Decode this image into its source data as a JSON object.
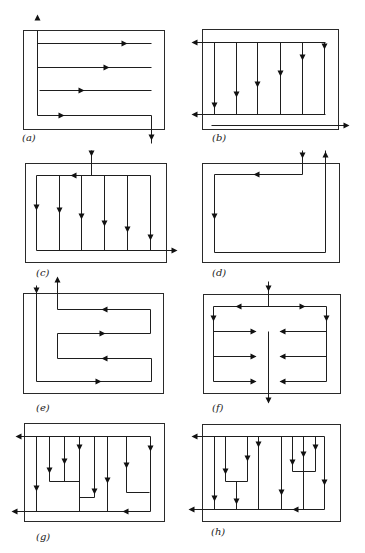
{
  "figure": {
    "width": 365,
    "height": 553,
    "colors": {
      "line": "#1e1e1e",
      "frame": "#2a2a2a",
      "background": "#ffffff"
    }
  },
  "panels": [
    {
      "id": "a",
      "label": "(a)",
      "label_pos": [
        22,
        141
      ],
      "frame": [
        23,
        30,
        164,
        129
      ],
      "paths": [
        [
          [
            37,
            30
          ],
          [
            37,
            115
          ],
          [
            151,
            115
          ],
          [
            151,
            143
          ]
        ],
        [
          [
            37,
            43
          ],
          [
            151,
            43
          ]
        ],
        [
          [
            37,
            67
          ],
          [
            151,
            67
          ]
        ],
        [
          [
            39,
            90
          ],
          [
            151,
            90
          ]
        ]
      ],
      "arrows": [
        {
          "x": 37,
          "y": 17,
          "dir": "up"
        },
        {
          "x": 124,
          "y": 43,
          "dir": "right"
        },
        {
          "x": 106,
          "y": 67,
          "dir": "right"
        },
        {
          "x": 81,
          "y": 90,
          "dir": "right"
        },
        {
          "x": 61,
          "y": 115,
          "dir": "right"
        },
        {
          "x": 151,
          "y": 137,
          "dir": "down"
        }
      ]
    },
    {
      "id": "b",
      "label": "(b)",
      "label_pos": [
        212,
        141
      ],
      "frame": [
        202,
        29,
        338,
        129
      ],
      "paths": [
        [
          [
            193,
            42
          ],
          [
            325,
            42
          ]
        ],
        [
          [
            193,
            114
          ],
          [
            325,
            114
          ]
        ],
        [
          [
            214,
            42
          ],
          [
            214,
            114
          ]
        ],
        [
          [
            236,
            42
          ],
          [
            236,
            114
          ]
        ],
        [
          [
            257,
            42
          ],
          [
            257,
            114
          ]
        ],
        [
          [
            280,
            42
          ],
          [
            280,
            114
          ]
        ],
        [
          [
            302,
            42
          ],
          [
            302,
            114
          ]
        ],
        [
          [
            324,
            42
          ],
          [
            324,
            114
          ]
        ],
        [
          [
            211,
            125
          ],
          [
            347,
            125
          ]
        ]
      ],
      "arrows": [
        {
          "x": 194,
          "y": 42,
          "dir": "left"
        },
        {
          "x": 194,
          "y": 114,
          "dir": "left"
        },
        {
          "x": 214,
          "y": 105,
          "dir": "down"
        },
        {
          "x": 236,
          "y": 94,
          "dir": "down"
        },
        {
          "x": 257,
          "y": 84,
          "dir": "down"
        },
        {
          "x": 280,
          "y": 73,
          "dir": "down"
        },
        {
          "x": 302,
          "y": 57,
          "dir": "down"
        },
        {
          "x": 324,
          "y": 46,
          "dir": "down"
        },
        {
          "x": 346,
          "y": 125,
          "dir": "right"
        }
      ]
    },
    {
      "id": "c",
      "label": "(c)",
      "label_pos": [
        36,
        276
      ],
      "frame": [
        25,
        163,
        166,
        262
      ],
      "paths": [
        [
          [
            91,
            150
          ],
          [
            91,
            175
          ]
        ],
        [
          [
            36,
            175
          ],
          [
            150,
            175
          ]
        ],
        [
          [
            36,
            175
          ],
          [
            36,
            250
          ]
        ],
        [
          [
            59,
            175
          ],
          [
            59,
            250
          ]
        ],
        [
          [
            81,
            175
          ],
          [
            81,
            250
          ]
        ],
        [
          [
            104,
            175
          ],
          [
            104,
            250
          ]
        ],
        [
          [
            127,
            175
          ],
          [
            127,
            250
          ]
        ],
        [
          [
            150,
            175
          ],
          [
            150,
            250
          ]
        ],
        [
          [
            36,
            250
          ],
          [
            175,
            250
          ]
        ]
      ],
      "arrows": [
        {
          "x": 91,
          "y": 153,
          "dir": "down"
        },
        {
          "x": 73,
          "y": 175,
          "dir": "left"
        },
        {
          "x": 36,
          "y": 207,
          "dir": "down"
        },
        {
          "x": 59,
          "y": 210,
          "dir": "down"
        },
        {
          "x": 81,
          "y": 216,
          "dir": "down"
        },
        {
          "x": 104,
          "y": 223,
          "dir": "down"
        },
        {
          "x": 127,
          "y": 229,
          "dir": "down"
        },
        {
          "x": 150,
          "y": 237,
          "dir": "down"
        },
        {
          "x": 174,
          "y": 250,
          "dir": "right"
        }
      ]
    },
    {
      "id": "d",
      "label": "(d)",
      "label_pos": [
        212,
        276
      ],
      "frame": [
        202,
        163,
        339,
        262
      ],
      "paths": [
        [
          [
            302,
            150
          ],
          [
            302,
            174
          ],
          [
            214,
            174
          ],
          [
            214,
            252
          ],
          [
            325,
            252
          ],
          [
            325,
            150
          ]
        ]
      ],
      "arrows": [
        {
          "x": 302,
          "y": 155,
          "dir": "down"
        },
        {
          "x": 256,
          "y": 174,
          "dir": "left"
        },
        {
          "x": 214,
          "y": 216,
          "dir": "down"
        },
        {
          "x": 325,
          "y": 154,
          "dir": "up"
        }
      ]
    },
    {
      "id": "e",
      "label": "(e)",
      "label_pos": [
        36,
        411
      ],
      "frame": [
        23,
        293,
        163,
        393
      ],
      "paths": [
        [
          [
            36,
            285
          ],
          [
            36,
            381
          ],
          [
            151,
            381
          ],
          [
            151,
            358
          ],
          [
            57,
            358
          ],
          [
            57,
            333
          ],
          [
            150,
            333
          ],
          [
            150,
            309
          ],
          [
            57,
            309
          ],
          [
            57,
            280
          ]
        ]
      ],
      "arrows": [
        {
          "x": 36,
          "y": 290,
          "dir": "down"
        },
        {
          "x": 57,
          "y": 279,
          "dir": "up"
        },
        {
          "x": 104,
          "y": 309,
          "dir": "left"
        },
        {
          "x": 102,
          "y": 333,
          "dir": "right"
        },
        {
          "x": 104,
          "y": 358,
          "dir": "left"
        },
        {
          "x": 98,
          "y": 381,
          "dir": "right"
        }
      ]
    },
    {
      "id": "f",
      "label": "(f)",
      "label_pos": [
        212,
        411
      ],
      "frame": [
        203,
        294,
        340,
        393
      ],
      "paths": [
        [
          [
            268,
            281
          ],
          [
            268,
            306
          ]
        ],
        [
          [
            213,
            306
          ],
          [
            326,
            306
          ]
        ],
        [
          [
            213,
            306
          ],
          [
            213,
            381
          ],
          [
            255,
            381
          ]
        ],
        [
          [
            326,
            306
          ],
          [
            326,
            381
          ],
          [
            280,
            381
          ]
        ],
        [
          [
            213,
            331
          ],
          [
            255,
            331
          ]
        ],
        [
          [
            213,
            356
          ],
          [
            255,
            356
          ]
        ],
        [
          [
            280,
            331
          ],
          [
            326,
            331
          ]
        ],
        [
          [
            280,
            356
          ],
          [
            326,
            356
          ]
        ],
        [
          [
            268,
            331
          ],
          [
            268,
            402
          ]
        ]
      ],
      "arrows": [
        {
          "x": 268,
          "y": 288,
          "dir": "down"
        },
        {
          "x": 238,
          "y": 306,
          "dir": "left"
        },
        {
          "x": 302,
          "y": 306,
          "dir": "right"
        },
        {
          "x": 213,
          "y": 318,
          "dir": "down"
        },
        {
          "x": 326,
          "y": 318,
          "dir": "down"
        },
        {
          "x": 253,
          "y": 331,
          "dir": "right"
        },
        {
          "x": 253,
          "y": 356,
          "dir": "right"
        },
        {
          "x": 253,
          "y": 381,
          "dir": "right"
        },
        {
          "x": 282,
          "y": 331,
          "dir": "left"
        },
        {
          "x": 282,
          "y": 356,
          "dir": "left"
        },
        {
          "x": 282,
          "y": 381,
          "dir": "left"
        },
        {
          "x": 268,
          "y": 400,
          "dir": "down"
        }
      ]
    },
    {
      "id": "g",
      "label": "(g)",
      "label_pos": [
        36,
        540
      ],
      "frame": [
        24,
        423,
        164,
        521
      ],
      "paths": [
        [
          [
            18,
            436
          ],
          [
            150,
            436
          ],
          [
            150,
            511
          ],
          [
            14,
            511
          ]
        ],
        [
          [
            36,
            436
          ],
          [
            36,
            511
          ]
        ],
        [
          [
            49,
            436
          ],
          [
            49,
            481
          ],
          [
            79,
            481
          ],
          [
            79,
            436
          ]
        ],
        [
          [
            64,
            436
          ],
          [
            64,
            481
          ]
        ],
        [
          [
            79,
            436
          ],
          [
            79,
            511
          ]
        ],
        [
          [
            79,
            497
          ],
          [
            94,
            497
          ],
          [
            94,
            436
          ]
        ],
        [
          [
            107,
            436
          ],
          [
            107,
            511
          ]
        ],
        [
          [
            126,
            436
          ],
          [
            126,
            492
          ],
          [
            149,
            492
          ]
        ]
      ],
      "arrows": [
        {
          "x": 18,
          "y": 436,
          "dir": "left"
        },
        {
          "x": 14,
          "y": 511,
          "dir": "left"
        },
        {
          "x": 36,
          "y": 488,
          "dir": "down"
        },
        {
          "x": 49,
          "y": 470,
          "dir": "down"
        },
        {
          "x": 64,
          "y": 461,
          "dir": "down"
        },
        {
          "x": 79,
          "y": 447,
          "dir": "down"
        },
        {
          "x": 94,
          "y": 491,
          "dir": "down"
        },
        {
          "x": 107,
          "y": 480,
          "dir": "down"
        },
        {
          "x": 126,
          "y": 465,
          "dir": "down"
        },
        {
          "x": 150,
          "y": 448,
          "dir": "down"
        },
        {
          "x": 125,
          "y": 511,
          "dir": "left"
        }
      ]
    },
    {
      "id": "h",
      "label": "(h)",
      "label_pos": [
        211,
        535
      ],
      "frame": [
        202,
        424,
        340,
        521
      ],
      "paths": [
        [
          [
            194,
            436
          ],
          [
            324,
            436
          ],
          [
            324,
            509
          ],
          [
            191,
            509
          ]
        ],
        [
          [
            214,
            436
          ],
          [
            214,
            509
          ]
        ],
        [
          [
            225,
            436
          ],
          [
            225,
            481
          ],
          [
            247,
            481
          ],
          [
            247,
            436
          ]
        ],
        [
          [
            236,
            481
          ],
          [
            236,
            509
          ]
        ],
        [
          [
            258,
            436
          ],
          [
            258,
            509
          ]
        ],
        [
          [
            281,
            436
          ],
          [
            281,
            509
          ]
        ],
        [
          [
            292,
            436
          ],
          [
            292,
            471
          ],
          [
            315,
            471
          ],
          [
            315,
            436
          ]
        ],
        [
          [
            303,
            436
          ],
          [
            303,
            509
          ]
        ]
      ],
      "arrows": [
        {
          "x": 194,
          "y": 436,
          "dir": "left"
        },
        {
          "x": 191,
          "y": 509,
          "dir": "left"
        },
        {
          "x": 214,
          "y": 498,
          "dir": "down"
        },
        {
          "x": 225,
          "y": 471,
          "dir": "down"
        },
        {
          "x": 236,
          "y": 501,
          "dir": "down"
        },
        {
          "x": 247,
          "y": 458,
          "dir": "down"
        },
        {
          "x": 258,
          "y": 444,
          "dir": "down"
        },
        {
          "x": 281,
          "y": 492,
          "dir": "down"
        },
        {
          "x": 292,
          "y": 462,
          "dir": "down"
        },
        {
          "x": 303,
          "y": 454,
          "dir": "down"
        },
        {
          "x": 315,
          "y": 447,
          "dir": "down"
        },
        {
          "x": 324,
          "y": 482,
          "dir": "down"
        },
        {
          "x": 295,
          "y": 509,
          "dir": "left"
        }
      ]
    }
  ]
}
